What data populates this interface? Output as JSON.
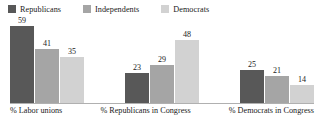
{
  "chart_data": {
    "type": "bar",
    "title": "",
    "subtitle": "",
    "xlabel": "",
    "ylabel": "",
    "ylim": [
      0,
      62
    ],
    "grid": false,
    "legend_position": "top-left",
    "orientation": "vertical",
    "grouping": "grouped",
    "categories": [
      "% Labor unions",
      "% Republicans in Congress",
      "% Democrats in Congress"
    ],
    "series": [
      {
        "name": "Republicans",
        "color": "#585858",
        "values": [
          59,
          23,
          25
        ]
      },
      {
        "name": "Independents",
        "color": "#a5a5a5",
        "values": [
          41,
          29,
          21
        ]
      },
      {
        "name": "Democrats",
        "color": "#d2d2d2",
        "values": [
          35,
          48,
          14
        ]
      }
    ],
    "value_labels": [
      [
        "59",
        "41",
        "35"
      ],
      [
        "23",
        "29",
        "48"
      ],
      [
        "25",
        "21",
        "14"
      ]
    ],
    "axis": {
      "baseline_color": "#b0b0b0",
      "show_y_axis": false,
      "show_ticks": false
    }
  },
  "legend": {
    "items": [
      {
        "label": "Republicans",
        "swatch": "legend-swatch-republicans",
        "color": "#585858"
      },
      {
        "label": "Independents",
        "swatch": "legend-swatch-independents",
        "color": "#a5a5a5"
      },
      {
        "label": "Democrats",
        "swatch": "legend-swatch-democrats",
        "color": "#d2d2d2"
      }
    ]
  }
}
